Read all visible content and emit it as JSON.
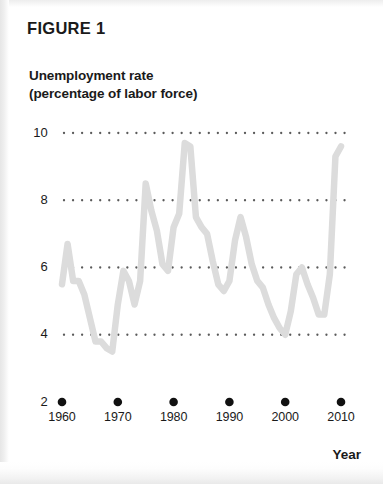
{
  "figure": {
    "title": "FIGURE 1"
  },
  "axes": {
    "y_title_line1": "Unemployment rate",
    "y_title_line2": "(percentage of labor force)",
    "x_title": "Year"
  },
  "colors": {
    "line": "#dcdcdc",
    "text": "#1a1a1a",
    "gridline_dot": "#5a5a5a",
    "tick_marker": "#111111",
    "background": "#ffffff"
  },
  "chart_data": {
    "type": "line",
    "title": "FIGURE 1",
    "xlabel": "Year",
    "ylabel": "Unemployment rate (percentage of labor force)",
    "xlim": [
      1960,
      2010
    ],
    "ylim": [
      2,
      10
    ],
    "yticks": [
      2,
      4,
      6,
      8,
      10
    ],
    "ytick_labels": [
      "2",
      "4",
      "6",
      "8",
      "10"
    ],
    "xticks": [
      1960,
      1970,
      1980,
      1990,
      2000,
      2010
    ],
    "xtick_labels": [
      "1960",
      "1970",
      "1980",
      "1990",
      "2000",
      "2010"
    ],
    "grid": "horizontal-dotted",
    "legend": "none",
    "series": [
      {
        "name": "Unemployment rate",
        "x": [
          1960,
          1961,
          1962,
          1963,
          1964,
          1965,
          1966,
          1967,
          1968,
          1969,
          1970,
          1971,
          1972,
          1973,
          1974,
          1975,
          1976,
          1977,
          1978,
          1979,
          1980,
          1981,
          1982,
          1983,
          1984,
          1985,
          1986,
          1987,
          1988,
          1989,
          1990,
          1991,
          1992,
          1993,
          1994,
          1995,
          1996,
          1997,
          1998,
          1999,
          2000,
          2001,
          2002,
          2003,
          2004,
          2005,
          2006,
          2007,
          2008,
          2009,
          2010
        ],
        "values": [
          5.5,
          6.7,
          5.6,
          5.6,
          5.2,
          4.5,
          3.8,
          3.8,
          3.6,
          3.5,
          4.9,
          5.9,
          5.6,
          4.9,
          5.6,
          8.5,
          7.7,
          7.1,
          6.1,
          5.9,
          7.2,
          7.6,
          9.7,
          9.6,
          7.5,
          7.2,
          7.0,
          6.2,
          5.5,
          5.3,
          5.6,
          6.8,
          7.5,
          6.9,
          6.1,
          5.6,
          5.4,
          4.9,
          4.5,
          4.2,
          4.0,
          4.7,
          5.8,
          6.0,
          5.5,
          5.1,
          4.6,
          4.6,
          5.8,
          9.3,
          9.6
        ]
      }
    ]
  }
}
